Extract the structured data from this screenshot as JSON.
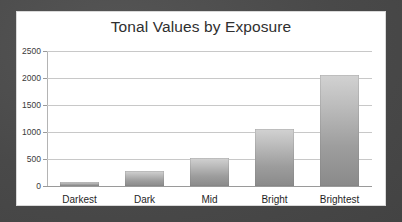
{
  "chart_data": {
    "type": "bar",
    "title": "Tonal Values by Exposure",
    "xlabel": "",
    "ylabel": "",
    "categories": [
      "Darkest",
      "Dark",
      "Mid",
      "Bright",
      "Brightest"
    ],
    "values": [
      70,
      270,
      520,
      1050,
      2050
    ],
    "ylim": [
      0,
      2500
    ],
    "yticks": [
      0,
      500,
      1000,
      1500,
      2000,
      2500
    ],
    "ytick_labels": [
      "0",
      "500",
      "1000",
      "1500",
      "2000",
      "2500"
    ],
    "grid": true,
    "legend": false,
    "bar_color_top": "#d2d2d2",
    "bar_color_bottom": "#8a8a8a",
    "gridline_color": "#c8c8c8",
    "panel_background": "#ffffff",
    "page_background": "#4d4d4d",
    "title_color": "#2f2f2f"
  }
}
